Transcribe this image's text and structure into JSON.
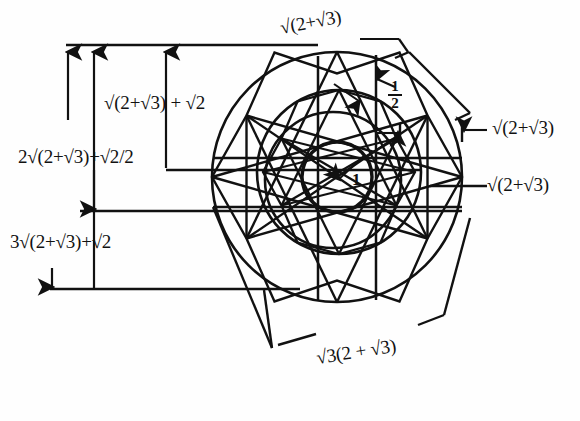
{
  "figure": {
    "background_color": "#fefefe",
    "ink_color": "#111111",
    "center": {
      "x": 337,
      "y": 177
    },
    "circles": [
      {
        "name": "inner-circle",
        "radius": 35,
        "label": "1"
      },
      {
        "name": "second-circle",
        "radius": 68
      },
      {
        "name": "third-circle",
        "radius": 82
      },
      {
        "name": "outer-circle",
        "radius": 125
      }
    ]
  },
  "labels": {
    "top": "√(2+√3)",
    "upper_left": "√(2+√3) + √2",
    "mid_left": "2√(2+√3)+√2/2",
    "lower_left": "3√(2+√3)+√2",
    "right_upper": "√(2+√3)",
    "right_lower": "√(2+√3)",
    "bottom": "√3(2 + √3)",
    "center_radius": "1",
    "half_numerator": "1",
    "half_denominator": "2"
  },
  "icon_names": {
    "arrow_up": "arrow-up-icon",
    "arrow_down": "arrow-down-icon",
    "arrow_left": "arrow-left-icon",
    "arrow_right": "arrow-right-icon",
    "dimension_line": "dimension-line-icon"
  }
}
